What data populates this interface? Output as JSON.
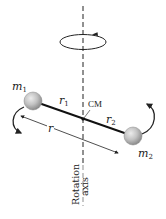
{
  "diagram": {
    "type": "physics-rotation-two-masses",
    "labels": {
      "mass1": "m",
      "mass1_sub": "1",
      "mass2": "m",
      "mass2_sub": "2",
      "r1": "r",
      "r1_sub": "1",
      "r2": "r",
      "r2_sub": "2",
      "r": "r",
      "cm": "CM",
      "axis_line1": "Rotation",
      "axis_line2": "axis"
    },
    "colors": {
      "background": "#ffffff",
      "line": "#222222",
      "ball_fill": "#c4c4c4",
      "ball_highlight": "#e8e8e8",
      "ball_shadow": "#8f8f8f"
    },
    "geometry": {
      "axis_x": 83,
      "cm": [
        83,
        119
      ],
      "mass1_center": [
        33,
        101
      ],
      "mass2_center": [
        133,
        136
      ],
      "ball_radius": 9
    }
  }
}
